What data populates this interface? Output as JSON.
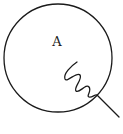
{
  "diagram": {
    "type": "circle-with-wavy-lead",
    "circle": {
      "cx": 58,
      "cy": 58,
      "r": 54,
      "stroke": "#1a1a1a"
    },
    "label": {
      "text": "A",
      "x": 57,
      "y": 46
    },
    "wavy_line": {
      "stroke": "#1a1a1a",
      "exits_at": [
        97,
        95
      ],
      "ends_at": [
        119,
        117
      ]
    }
  }
}
